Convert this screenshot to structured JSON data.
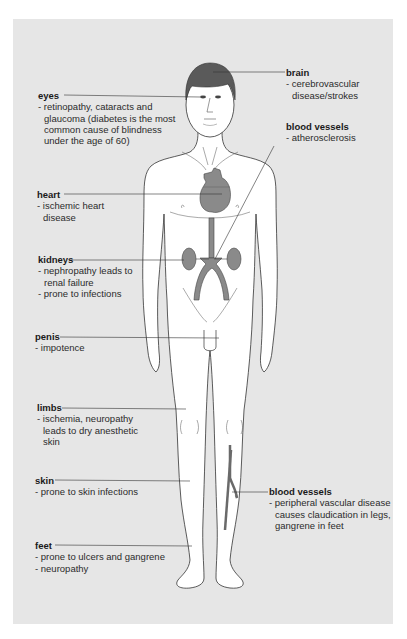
{
  "diagram": {
    "colors": {
      "background_panel": "#e6e6e6",
      "body_fill": "#ffffff",
      "organ_fill": "#8a8a8a",
      "hair_fill": "#5a5a5a",
      "outline": "#333333",
      "text": "#2b2b2b"
    },
    "labels": {
      "eyes": {
        "title": "eyes",
        "lines": [
          "- retinopathy, cataracts and",
          "glaucoma (diabetes is the most",
          "common cause of blindness",
          "under the age of 60)"
        ]
      },
      "brain": {
        "title": "brain",
        "lines": [
          "- cerebrovascular",
          "disease/strokes"
        ]
      },
      "blood_vessels_upper": {
        "title": "blood vessels",
        "lines": [
          "- atherosclerosis"
        ]
      },
      "heart": {
        "title": "heart",
        "lines": [
          "- ischemic heart",
          "disease"
        ]
      },
      "kidneys": {
        "title": "kidneys",
        "lines": [
          "- nephropathy leads to",
          "renal failure",
          "- prone to infections"
        ]
      },
      "penis": {
        "title": "penis",
        "lines": [
          "- impotence"
        ]
      },
      "limbs": {
        "title": "limbs",
        "lines": [
          "- ischemia, neuropathy",
          "leads to dry anesthetic",
          "skin"
        ]
      },
      "skin": {
        "title": "skin",
        "lines": [
          "- prone to skin infections"
        ]
      },
      "blood_vessels_lower": {
        "title": "blood vessels",
        "lines": [
          "- peripheral vascular disease",
          "causes claudication in legs,",
          "gangrene in feet"
        ]
      },
      "feet": {
        "title": "feet",
        "lines": [
          "- prone to ulcers and gangrene",
          "- neuropathy"
        ]
      }
    }
  }
}
